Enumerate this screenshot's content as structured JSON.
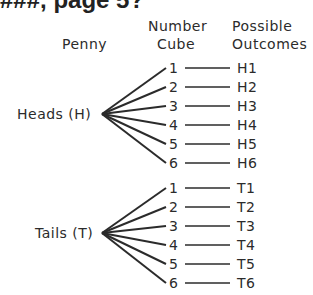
{
  "heading": "###, page 5?",
  "headers": {
    "penny": "Penny",
    "number_cube_1": "Number",
    "number_cube_2": "Cube",
    "outcomes_1": "Possible",
    "outcomes_2": "Outcomes"
  },
  "branches": [
    {
      "label": "Heads (H)",
      "cube": [
        "1",
        "2",
        "3",
        "4",
        "5",
        "6"
      ],
      "outcomes": [
        "H1",
        "H2",
        "H3",
        "H4",
        "H5",
        "H6"
      ]
    },
    {
      "label": "Tails (T)",
      "cube": [
        "1",
        "2",
        "3",
        "4",
        "5",
        "6"
      ],
      "outcomes": [
        "T1",
        "T2",
        "T3",
        "T4",
        "T5",
        "T6"
      ]
    }
  ],
  "colors": {
    "ink": "#2b2b2b",
    "background": "#ffffff"
  }
}
